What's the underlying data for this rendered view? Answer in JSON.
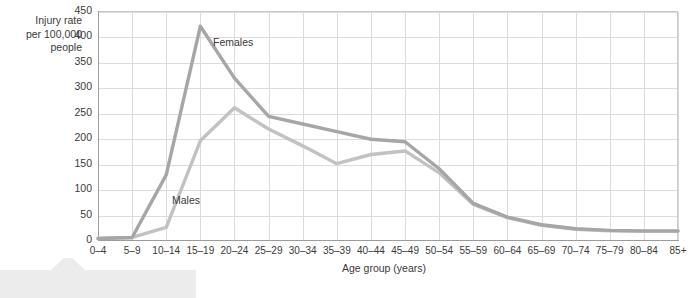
{
  "chart_data": {
    "type": "line",
    "title": "",
    "xlabel": "Age group (years)",
    "ylabel": "Injury rate per 100,000 people",
    "ylabel_lines": [
      "Injury rate",
      "per 100,000",
      "people"
    ],
    "categories": [
      "0–4",
      "5–9",
      "10–14",
      "15–19",
      "20–24",
      "25–29",
      "30–34",
      "35–39",
      "40–44",
      "45–49",
      "50–54",
      "55–59",
      "60–64",
      "65–69",
      "70–74",
      "75–79",
      "80–84",
      "85+"
    ],
    "yticks": [
      0,
      50,
      100,
      150,
      200,
      250,
      300,
      350,
      400,
      450
    ],
    "ylim": [
      0,
      450
    ],
    "grid": true,
    "legend": "inline-labels",
    "series": [
      {
        "name": "Females",
        "color": "#a6a6a6",
        "values": [
          3,
          5,
          128,
          420,
          318,
          243,
          228,
          213,
          198,
          193,
          140,
          72,
          45,
          30,
          22,
          19,
          18,
          18
        ]
      },
      {
        "name": "Males",
        "color": "#c2c2c2",
        "values": [
          3,
          5,
          25,
          195,
          260,
          218,
          185,
          150,
          168,
          175,
          132,
          70,
          44,
          29,
          21,
          18,
          17,
          17
        ]
      }
    ],
    "annotations": [
      {
        "text": "Females",
        "series": "Females"
      },
      {
        "text": "Males",
        "series": "Males"
      }
    ]
  },
  "colors": {
    "females_line": "#a6a6a6",
    "males_line": "#c2c2c2",
    "gridline": "#dcdcdc",
    "axis": "#9b9b9b",
    "text": "#3a3a3a",
    "callout": "#e9e9e9",
    "background": "#ffffff"
  }
}
